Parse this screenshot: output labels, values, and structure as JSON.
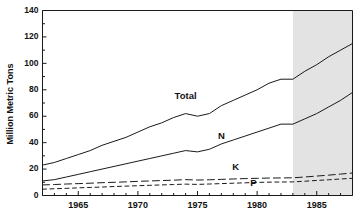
{
  "chart_data": {
    "type": "line",
    "title": "",
    "xlabel": "",
    "ylabel": "Million Metric Tons",
    "xlim": [
      1962,
      1988
    ],
    "ylim": [
      0,
      140
    ],
    "yticks": [
      0,
      20,
      40,
      60,
      80,
      100,
      120,
      140
    ],
    "ytick_labels": [
      "0",
      "20",
      "40",
      "60",
      "80",
      "100",
      "120",
      "140"
    ],
    "xticks": [
      1965,
      1970,
      1975,
      1980,
      1985
    ],
    "xtick_labels": [
      "1965",
      "1970",
      "1975",
      "1980",
      "1985"
    ],
    "minor_xticks_every": 1,
    "grid": false,
    "legend_position": "inline-labels",
    "forecast_shading": {
      "label": "",
      "start_year": 1983,
      "end_year": 1988,
      "color": "#e3e3e3"
    },
    "x": [
      1962,
      1963,
      1964,
      1965,
      1966,
      1967,
      1968,
      1969,
      1970,
      1971,
      1972,
      1973,
      1974,
      1975,
      1976,
      1977,
      1978,
      1979,
      1980,
      1981,
      1982,
      1983,
      1984,
      1985,
      1986,
      1987,
      1988
    ],
    "series": [
      {
        "name": "Total",
        "label": "Total",
        "style": "solid",
        "color": "#1a1a1a",
        "values": [
          23,
          25,
          28,
          31,
          34,
          38,
          41,
          44,
          48,
          52,
          55,
          59,
          62,
          60,
          62,
          68,
          72,
          76,
          80,
          85,
          88,
          88,
          94,
          99,
          105,
          110,
          115
        ]
      },
      {
        "name": "N",
        "label": "N",
        "style": "solid",
        "color": "#1a1a1a",
        "values": [
          11,
          12,
          14,
          16,
          18,
          20,
          22,
          24,
          26,
          28,
          30,
          32,
          34,
          33,
          35,
          39,
          42,
          45,
          48,
          51,
          54,
          54,
          58,
          62,
          67,
          72,
          78
        ]
      },
      {
        "name": "K",
        "label": "K",
        "style": "long-dash",
        "color": "#1a1a1a",
        "values": [
          8,
          8.3,
          8.7,
          9,
          9.3,
          9.7,
          10,
          10.3,
          10.7,
          11,
          11.3,
          11.6,
          12,
          11.7,
          11.9,
          12.2,
          12.5,
          12.8,
          13,
          13.2,
          13.3,
          13.4,
          14,
          14.7,
          15.4,
          16.2,
          17
        ]
      },
      {
        "name": "P",
        "label": "P",
        "style": "short-dash",
        "color": "#1a1a1a",
        "values": [
          4.8,
          5.1,
          5.4,
          5.8,
          6.1,
          6.4,
          6.8,
          7.1,
          7.4,
          7.7,
          8,
          8.3,
          8.6,
          8.4,
          8.7,
          9,
          9.3,
          9.6,
          9.9,
          10.1,
          10.2,
          10.3,
          10.8,
          11.4,
          11.9,
          12.5,
          13
        ]
      }
    ],
    "annotations": [
      {
        "name": "total-label",
        "text": "Total",
        "x": 1974.0,
        "y": 73
      },
      {
        "name": "n-label",
        "text": "N",
        "x": 1977.0,
        "y": 43
      },
      {
        "name": "k-label",
        "text": "K",
        "x": 1978.2,
        "y": 19
      },
      {
        "name": "p-label",
        "text": "P",
        "x": 1979.7,
        "y": 7.5
      }
    ]
  }
}
